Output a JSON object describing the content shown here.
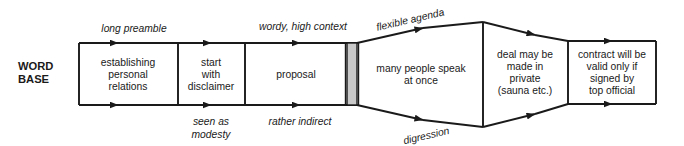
{
  "diagram": {
    "title_label": {
      "line1": "WORD",
      "line2": "BASE"
    },
    "stages": [
      {
        "id": "establishing-personal-relations",
        "lines": [
          "establishing",
          "personal",
          "relations"
        ]
      },
      {
        "id": "start-with-disclaimer",
        "lines": [
          "start",
          "with",
          "disclaimer"
        ]
      },
      {
        "id": "proposal",
        "lines": [
          "proposal"
        ]
      },
      {
        "id": "many-people-speak-at-once",
        "lines": [
          "many people speak",
          "at once"
        ]
      },
      {
        "id": "deal-may-be-made-in-private",
        "lines": [
          "deal may be",
          "made in",
          "private",
          "(sauna etc.)"
        ]
      },
      {
        "id": "contract-will-be-valid",
        "lines": [
          "contract will be",
          "valid only if",
          "signed by",
          "top official"
        ]
      }
    ],
    "annotations": {
      "top": [
        {
          "id": "long-preamble",
          "text": "long preamble"
        },
        {
          "id": "wordy-high-context",
          "text": "wordy, high context"
        },
        {
          "id": "flexible-agenda",
          "text": "flexible agenda"
        }
      ],
      "bottom": [
        {
          "id": "seen-as-modesty",
          "line1": "seen as",
          "line2": "modesty"
        },
        {
          "id": "rather-indirect",
          "text": "rather indirect"
        },
        {
          "id": "digression",
          "text": "digression"
        }
      ]
    },
    "colors": {
      "stroke": "#1a1a1a",
      "gray_bar_fill": "#c9c9c9",
      "background": "#ffffff"
    }
  }
}
